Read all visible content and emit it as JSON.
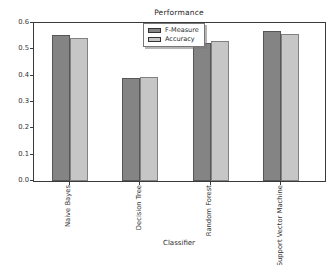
{
  "chart_data": {
    "type": "bar",
    "title": "Performance",
    "xlabel": "Classifier",
    "ylabel": "",
    "categories": [
      "Naive Bayes",
      "Decision Tree",
      "Random Forest",
      "Support Vector Machine"
    ],
    "series": [
      {
        "name": "F-Measure",
        "color": "#848484",
        "values": [
          0.555,
          0.39,
          0.525,
          0.57
        ]
      },
      {
        "name": "Accuracy",
        "color": "#c6c6c6",
        "values": [
          0.545,
          0.395,
          0.53,
          0.56
        ]
      }
    ],
    "ylim": [
      0,
      0.6
    ],
    "ytick_labels": [
      "0.0",
      "0.1",
      "0.2",
      "0.3",
      "0.4",
      "0.5",
      "0.6"
    ],
    "legend_position": "upper center",
    "grid": false,
    "colors": {
      "axis": "#3a3a3a",
      "text": "#333333",
      "background": "#ffffff"
    }
  }
}
